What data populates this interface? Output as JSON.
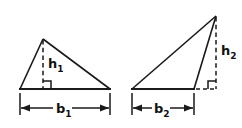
{
  "figure": {
    "background_color": "#ffffff",
    "stroke_color": "#1a1a1a",
    "label_color": "#111111"
  },
  "triangles": [
    {
      "id": "left-triangle",
      "name": "acute-triangle",
      "kind": "acute",
      "vertices": [
        [
          20,
          89
        ],
        [
          110,
          89
        ],
        [
          43,
          39
        ]
      ],
      "base": {
        "label": "b",
        "subscript": "1",
        "from": [
          20,
          89
        ],
        "to": [
          110,
          89
        ]
      },
      "height": {
        "label": "h",
        "subscript": "1",
        "style": "dashed",
        "from": [
          43,
          39
        ],
        "to": [
          43,
          89
        ],
        "foot_inside_base": true
      },
      "right_angle_marker": {
        "at": [
          43,
          89
        ],
        "size": 8,
        "opens": "right"
      }
    },
    {
      "id": "right-triangle",
      "name": "obtuse-triangle",
      "kind": "obtuse",
      "vertices": [
        [
          132,
          89
        ],
        [
          194,
          89
        ],
        [
          216,
          16
        ]
      ],
      "base": {
        "label": "b",
        "subscript": "2",
        "from": [
          132,
          89
        ],
        "to": [
          194,
          89
        ]
      },
      "height": {
        "label": "h",
        "subscript": "2",
        "style": "dashed",
        "from": [
          216,
          16
        ],
        "to": [
          216,
          89
        ],
        "foot_inside_base": false
      },
      "base_extension": {
        "style": "dashed",
        "from": [
          196,
          89
        ],
        "to": [
          216,
          89
        ]
      },
      "right_angle_marker": {
        "at": [
          216,
          89
        ],
        "size": 8,
        "opens": "left"
      }
    }
  ],
  "labels": {
    "h1": {
      "text": "h",
      "sub": "1",
      "x": 49,
      "y": 68
    },
    "b1": {
      "text": "b",
      "sub": "1",
      "x": 58,
      "y": 114
    },
    "h2": {
      "text": "h",
      "sub": "2",
      "x": 222,
      "y": 55
    },
    "b2": {
      "text": "b",
      "sub": "2",
      "x": 156,
      "y": 114
    }
  },
  "dimension_lines": [
    {
      "id": "b1-dimension",
      "y": 108,
      "x_start": 20,
      "x_end": 110,
      "ext_top": 92,
      "ext_bottom": 114,
      "arrows": "inward"
    },
    {
      "id": "b2-dimension",
      "y": 108,
      "x_start": 132,
      "x_end": 194,
      "ext_top": 92,
      "ext_bottom": 114,
      "arrows": "inward"
    }
  ]
}
